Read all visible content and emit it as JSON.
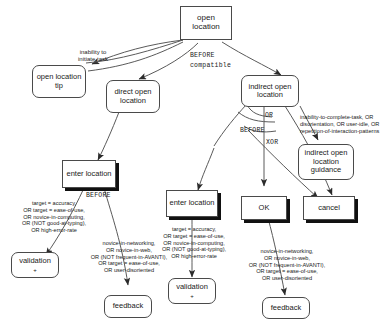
{
  "diagram": {
    "nodes": {
      "open_location": "open location",
      "open_location_tip": "open location tip",
      "direct_open_location": "direct open location",
      "indirect_open_location": "indirect open location",
      "indirect_open_location_guidance": "indirect open location guidance",
      "enter_location_left": "enter location",
      "enter_location_mid": "enter location",
      "ok": "OK",
      "cancel": "cancel",
      "validation_left": "validation",
      "validation_mid": "validation",
      "feedback_mid": "feedback",
      "feedback_right": "feedback",
      "plus_sign": "+"
    },
    "operators": {
      "before_top": "BEFORE",
      "compatible_top": "compatible",
      "or_mid": "OR",
      "before_mid": "BEFORE",
      "xor_mid": "XOR",
      "before_left": "BEFORE"
    },
    "conditions": {
      "inability_initiate": "inability to initiate task",
      "inability_initiate_line1": "inability to",
      "inability_initiate_line2": "initiate task",
      "indirect_trigger_line1": "inability-to-complete-task, OR",
      "indirect_trigger_line2": "disorientation, OR user-idle, OR",
      "indirect_trigger_line3": "repetition-of-interaction-patterns",
      "validation_cond_line1": "target = accuracy,",
      "validation_cond_line2": "OR target = ease-of-use,",
      "validation_cond_line3": "OR novice-in-computing,",
      "validation_cond_line4": "OR (NOT good-at-typing),",
      "validation_cond_line5": "OR high-error-rate",
      "feedback_cond_line1": "novice-in-networking,",
      "feedback_cond_line2": "OR novice-in-web,",
      "feedback_cond_line3": "OR (NOT frequent-in-AVANTI),",
      "feedback_cond_line4": "OR target = ease-of-use,",
      "feedback_cond_line5": "OR user-disoriented"
    },
    "colors": {
      "stroke": "#4a4a4a",
      "shadow": "#111111",
      "background": "#ffffff",
      "text": "#1a1a1a"
    }
  }
}
